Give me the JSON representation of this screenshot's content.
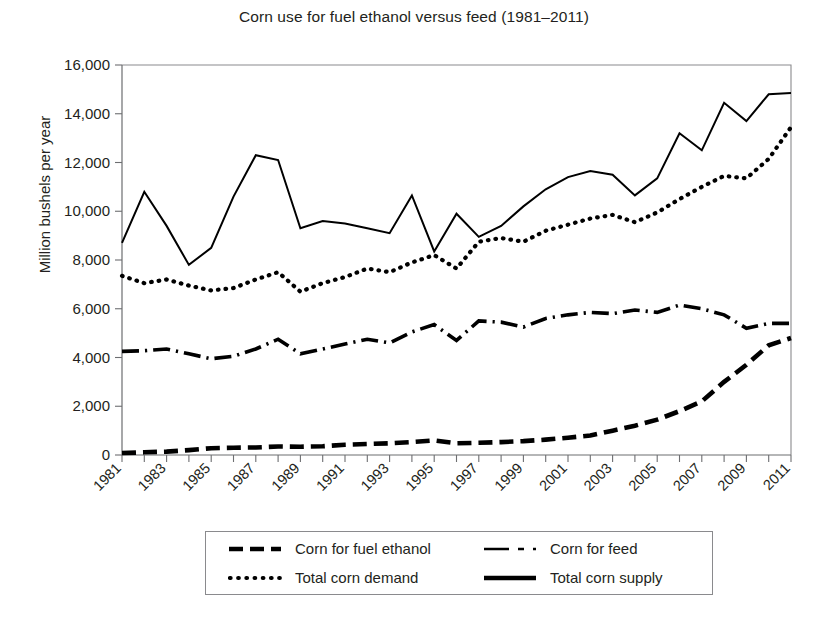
{
  "chart_data": {
    "type": "line",
    "title": "Corn use for fuel ethanol versus feed (1981–2011)",
    "xlabel": "",
    "ylabel": "Million bushels per year",
    "ylim": [
      0,
      16000
    ],
    "ytick_labels": [
      "16,000",
      "14,000",
      "12,000",
      "10,000",
      "8,000",
      "6,000",
      "4,000",
      "2,000",
      "0"
    ],
    "ytick_values": [
      16000,
      14000,
      12000,
      10000,
      8000,
      6000,
      4000,
      2000,
      0
    ],
    "xlim": [
      1981,
      2011
    ],
    "xtick_labels": [
      "1981",
      "1983",
      "1985",
      "1987",
      "1989",
      "1991",
      "1993",
      "1995",
      "1997",
      "1999",
      "2001",
      "2003",
      "2005",
      "2007",
      "2009",
      "2011"
    ],
    "xtick_values": [
      1981,
      1983,
      1985,
      1987,
      1989,
      1991,
      1993,
      1995,
      1997,
      1999,
      2001,
      2003,
      2005,
      2007,
      2009,
      2011
    ],
    "x": [
      1981,
      1982,
      1983,
      1984,
      1985,
      1986,
      1987,
      1988,
      1989,
      1990,
      1991,
      1992,
      1993,
      1994,
      1995,
      1996,
      1997,
      1998,
      1999,
      2000,
      2001,
      2002,
      2003,
      2004,
      2005,
      2006,
      2007,
      2008,
      2009,
      2010,
      2011
    ],
    "grid": false,
    "legend_position": "below-center",
    "series": [
      {
        "name": "Corn for fuel ethanol",
        "style": "thick-dashed",
        "color": "#000000",
        "values": [
          80,
          110,
          140,
          200,
          280,
          300,
          310,
          350,
          340,
          360,
          420,
          450,
          480,
          530,
          600,
          480,
          500,
          530,
          570,
          630,
          710,
          800,
          1000,
          1200,
          1450,
          1800,
          2200,
          3000,
          3700,
          4500,
          4800
        ]
      },
      {
        "name": "Corn for feed",
        "style": "dash-dot",
        "color": "#000000",
        "values": [
          4250,
          4280,
          4350,
          4150,
          3950,
          4050,
          4350,
          4750,
          4150,
          4350,
          4550,
          4750,
          4600,
          5050,
          5350,
          4700,
          5500,
          5450,
          5250,
          5600,
          5750,
          5850,
          5800,
          5950,
          5850,
          6150,
          6000,
          5750,
          5200,
          5400,
          5400
        ]
      },
      {
        "name": "Total corn demand",
        "style": "dotted",
        "color": "#000000",
        "values": [
          7350,
          7050,
          7200,
          6950,
          6750,
          6850,
          7200,
          7500,
          6700,
          7050,
          7300,
          7650,
          7500,
          7900,
          8200,
          7650,
          8750,
          8900,
          8750,
          9200,
          9450,
          9700,
          9850,
          9550,
          9950,
          10500,
          11000,
          11450,
          11350,
          12150,
          13450
        ]
      },
      {
        "name": "Total corn supply",
        "style": "solid",
        "color": "#000000",
        "values": [
          8700,
          10800,
          9400,
          7800,
          8500,
          10600,
          12300,
          12100,
          9300,
          9600,
          9500,
          9300,
          9100,
          10650,
          8350,
          9900,
          8950,
          9400,
          10200,
          10900,
          11400,
          11650,
          11500,
          10650,
          11350,
          13200,
          12500,
          14450,
          13700,
          14800,
          14850
        ]
      }
    ]
  },
  "legend": {
    "items": [
      {
        "label": "Corn for fuel ethanol",
        "swatch": "thick-dashed-swatch"
      },
      {
        "label": "Corn for feed",
        "swatch": "dash-dot-swatch"
      },
      {
        "label": "Total corn demand",
        "swatch": "dotted-swatch"
      },
      {
        "label": "Total corn supply",
        "swatch": "solid-swatch"
      }
    ]
  }
}
